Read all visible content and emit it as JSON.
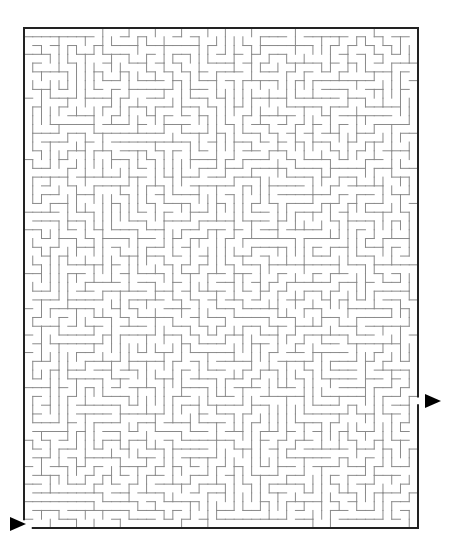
{
  "puzzle": {
    "type": "rectangular-maze",
    "grid": {
      "cols": 45,
      "rows": 57
    },
    "bounds": {
      "left": 24,
      "top": 28,
      "right": 418,
      "bottom": 528
    },
    "seed": 20240611,
    "entrance": {
      "side": "left",
      "row": 56,
      "marker": "triangle-arrow-right"
    },
    "exit": {
      "side": "right",
      "row": 42,
      "marker": "triangle-arrow-right"
    }
  },
  "colors": {
    "background": "#ffffff",
    "wall": "#8a8a8a",
    "border": "#222222",
    "arrow": "#000000"
  },
  "icons": {
    "entrance_arrow": "play-triangle-icon",
    "exit_arrow": "play-triangle-icon"
  }
}
